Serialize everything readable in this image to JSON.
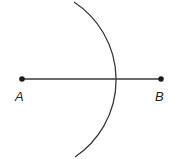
{
  "diagram": {
    "type": "geometric-construction",
    "points": [
      {
        "id": "A",
        "label": "A",
        "x": 22,
        "y": 79
      },
      {
        "id": "B",
        "label": "B",
        "x": 161,
        "y": 79
      }
    ],
    "segment": {
      "from": "A",
      "to": "B"
    },
    "arc": {
      "center": "A",
      "radius": 93,
      "start": {
        "x": 74,
        "y": 2
      },
      "end": {
        "x": 75,
        "y": 157
      }
    },
    "colors": {
      "stroke": "#3a3a3a",
      "point": "#1a1a1a",
      "label": "#222222"
    }
  }
}
